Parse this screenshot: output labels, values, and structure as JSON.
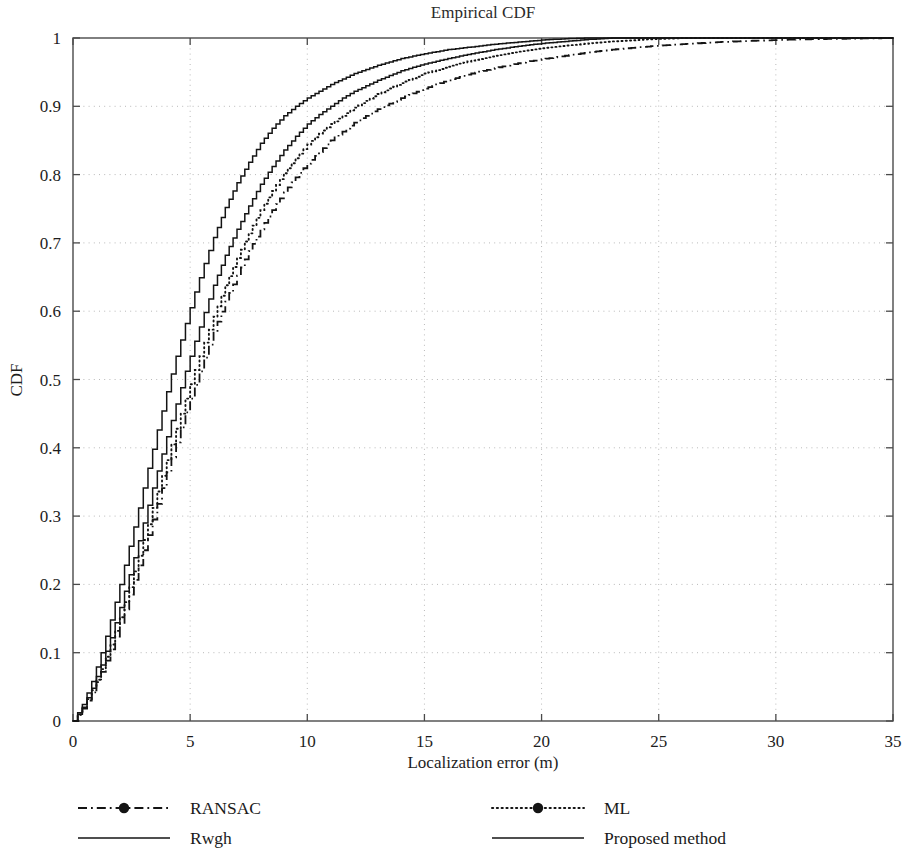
{
  "chart_data": {
    "type": "line",
    "title": "Empirical CDF",
    "xlabel": "Localization error (m)",
    "ylabel": "CDF",
    "xlim": [
      0,
      35
    ],
    "ylim": [
      0,
      1
    ],
    "xticks": [
      0,
      5,
      10,
      15,
      20,
      25,
      30,
      35
    ],
    "xtick_labels": [
      "0",
      "5",
      "10",
      "15",
      "20",
      "25",
      "30",
      "35"
    ],
    "yticks": [
      0,
      0.1,
      0.2,
      0.3,
      0.4,
      0.5,
      0.6,
      0.7,
      0.8,
      0.9,
      1
    ],
    "ytick_labels": [
      "0",
      "0.1",
      "0.2",
      "0.3",
      "0.4",
      "0.5",
      "0.6",
      "0.7",
      "0.8",
      "0.9",
      "1"
    ],
    "grid": true,
    "grid_style": "dotted",
    "grid_color": "#b9b9b9",
    "legend_position": "below-axes",
    "legend_columns": 2,
    "series": [
      {
        "name": "RANSAC",
        "style": "dashdot",
        "marker": "circle",
        "color": "#141414",
        "x": [
          0,
          0.4,
          0.8,
          1.2,
          1.6,
          2.0,
          2.4,
          2.8,
          3.2,
          3.6,
          4.0,
          4.4,
          4.8,
          5.2,
          5.6,
          6.0,
          6.5,
          7.0,
          7.5,
          8.0,
          8.5,
          9.0,
          9.5,
          10.0,
          11.0,
          12.0,
          13.0,
          14.0,
          15.0,
          16.0,
          17.0,
          18.0,
          19.0,
          20.0,
          21.0,
          22.0,
          23.0,
          24.0,
          25.0,
          26.0,
          27.5,
          29.0,
          31.0,
          33.0,
          35.0
        ],
        "y": [
          0,
          0.018,
          0.042,
          0.072,
          0.105,
          0.142,
          0.185,
          0.228,
          0.272,
          0.318,
          0.364,
          0.408,
          0.452,
          0.492,
          0.532,
          0.57,
          0.614,
          0.652,
          0.688,
          0.72,
          0.748,
          0.774,
          0.796,
          0.816,
          0.85,
          0.876,
          0.896,
          0.912,
          0.926,
          0.938,
          0.948,
          0.956,
          0.963,
          0.969,
          0.974,
          0.979,
          0.983,
          0.986,
          0.989,
          0.991,
          0.994,
          0.996,
          0.998,
          0.999,
          1.0
        ]
      },
      {
        "name": "Rwgh",
        "style": "solid",
        "marker": "none",
        "color": "#141414",
        "x": [
          0,
          0.4,
          0.8,
          1.2,
          1.6,
          2.0,
          2.4,
          2.8,
          3.2,
          3.6,
          4.0,
          4.4,
          4.8,
          5.2,
          5.6,
          6.0,
          6.5,
          7.0,
          7.5,
          8.0,
          8.5,
          9.0,
          9.5,
          10.0,
          10.5,
          11.0,
          11.5,
          12.0,
          13.0,
          14.0,
          15.0,
          16.0,
          17.0,
          18.0,
          19.0,
          20.0,
          21.0,
          22.0,
          23.0
        ],
        "y": [
          0,
          0.02,
          0.048,
          0.082,
          0.122,
          0.166,
          0.214,
          0.264,
          0.316,
          0.366,
          0.416,
          0.464,
          0.512,
          0.556,
          0.598,
          0.638,
          0.682,
          0.72,
          0.754,
          0.786,
          0.812,
          0.836,
          0.856,
          0.874,
          0.888,
          0.9,
          0.912,
          0.922,
          0.938,
          0.952,
          0.962,
          0.97,
          0.977,
          0.983,
          0.988,
          0.992,
          0.995,
          0.998,
          1.0
        ]
      },
      {
        "name": "ML",
        "style": "dotted",
        "marker": "circle",
        "color": "#141414",
        "x": [
          0,
          0.4,
          0.8,
          1.2,
          1.6,
          2.0,
          2.4,
          2.8,
          3.2,
          3.6,
          4.0,
          4.4,
          4.8,
          5.2,
          5.6,
          6.0,
          6.5,
          7.0,
          7.5,
          8.0,
          8.5,
          9.0,
          9.5,
          10.0,
          10.5,
          11.0,
          11.5,
          12.0,
          13.0,
          14.0,
          15.0,
          16.0,
          17.0,
          18.0,
          19.0,
          20.0,
          21.0,
          22.0,
          23.0,
          24.5,
          26.0
        ],
        "y": [
          0,
          0.019,
          0.045,
          0.076,
          0.112,
          0.152,
          0.196,
          0.242,
          0.288,
          0.336,
          0.382,
          0.428,
          0.472,
          0.514,
          0.554,
          0.592,
          0.638,
          0.678,
          0.714,
          0.748,
          0.776,
          0.802,
          0.824,
          0.844,
          0.86,
          0.874,
          0.886,
          0.898,
          0.918,
          0.934,
          0.948,
          0.958,
          0.967,
          0.974,
          0.98,
          0.985,
          0.989,
          0.992,
          0.995,
          0.998,
          1.0
        ]
      },
      {
        "name": "Proposed method",
        "style": "solid",
        "marker": "none",
        "color": "#141414",
        "x": [
          0,
          0.4,
          0.8,
          1.2,
          1.6,
          2.0,
          2.4,
          2.8,
          3.2,
          3.6,
          4.0,
          4.4,
          4.8,
          5.2,
          5.6,
          6.0,
          6.5,
          7.0,
          7.5,
          8.0,
          8.5,
          9.0,
          9.5,
          10.0,
          10.5,
          11.0,
          11.5,
          12.0,
          13.0,
          14.0,
          15.0,
          16.0,
          17.0,
          18.0,
          19.0,
          20.0,
          21.0,
          22.0
        ],
        "y": [
          0,
          0.024,
          0.058,
          0.1,
          0.148,
          0.2,
          0.256,
          0.312,
          0.37,
          0.426,
          0.482,
          0.534,
          0.582,
          0.628,
          0.67,
          0.708,
          0.752,
          0.788,
          0.818,
          0.846,
          0.868,
          0.886,
          0.9,
          0.912,
          0.922,
          0.932,
          0.94,
          0.948,
          0.96,
          0.97,
          0.977,
          0.983,
          0.987,
          0.991,
          0.994,
          0.997,
          0.999,
          1.0
        ]
      }
    ]
  },
  "legend": {
    "entries": [
      {
        "label": "RANSAC",
        "style": "dashdot",
        "marker": "circle"
      },
      {
        "label": "ML",
        "style": "dotted",
        "marker": "circle"
      },
      {
        "label": "Rwgh",
        "style": "solid",
        "marker": "none"
      },
      {
        "label": "Proposed method",
        "style": "solid",
        "marker": "none"
      }
    ]
  }
}
